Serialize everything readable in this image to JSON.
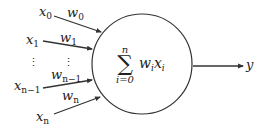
{
  "diagram": {
    "inputs": [
      {
        "x_base": "x",
        "x_sub": "0",
        "w_base": "w",
        "w_sub": "0"
      },
      {
        "x_base": "x",
        "x_sub": "1",
        "w_base": "w",
        "w_sub": "1"
      },
      {
        "x_base": "x",
        "x_sub": "n−1",
        "w_base": "w",
        "w_sub": "n−1"
      },
      {
        "x_base": "x",
        "x_sub": "n",
        "w_base": "w",
        "w_sub": "n"
      }
    ],
    "ellipsis": "⋮",
    "node": {
      "sum_symbol": "∑",
      "upper_limit": "n",
      "lower_limit": "i=0",
      "term_w": "w",
      "term_w_sub": "i",
      "term_x": "x",
      "term_x_sub": "i"
    },
    "output": {
      "label": "y"
    },
    "colors": {
      "stroke": "#333333",
      "text": "#222222",
      "background": "#ffffff"
    }
  }
}
